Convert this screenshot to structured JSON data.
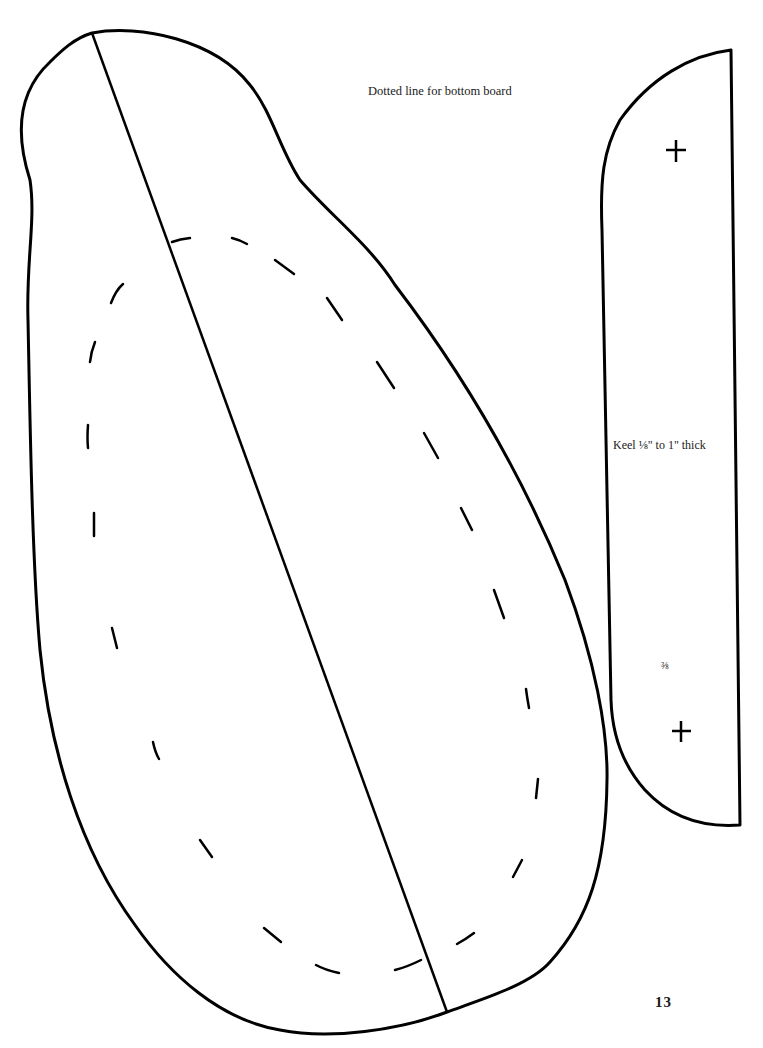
{
  "page": {
    "page_number": "13"
  },
  "hull_pattern": {
    "caption": "Dotted line for bottom board",
    "parts": [
      "hull-outline",
      "center-line",
      "bottom-board-dotted-line"
    ]
  },
  "keel_pattern": {
    "caption": "Keel ⅛\" to 1\" thick",
    "fraction_mark": "⅜",
    "marks": [
      "plus-mark-top",
      "plus-mark-bottom"
    ]
  },
  "colors": {
    "line": "#000000",
    "background": "#ffffff",
    "text": "#1a1a1a"
  }
}
